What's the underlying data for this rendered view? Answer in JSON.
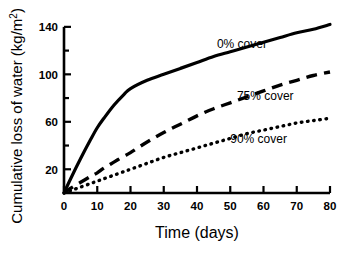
{
  "chart_data": {
    "type": "line",
    "title": "",
    "xlabel": "Time (days)",
    "ylabel": "Cumulative loss of water (kg/m",
    "ylabel_sup": "2",
    "ylabel_tail": ")",
    "xlim": [
      0,
      80
    ],
    "ylim": [
      0,
      150
    ],
    "grid": false,
    "legend_position": "inline-annotations",
    "x_ticks_major": [
      0,
      10,
      20,
      30,
      40,
      50,
      60,
      70,
      80
    ],
    "x_tick_labels": [
      "0",
      "10",
      "20",
      "30",
      "40",
      "50",
      "60",
      "70",
      "80"
    ],
    "y_ticks_major": [
      20,
      60,
      100,
      140
    ],
    "y_tick_labels": [
      "20",
      "60",
      "100",
      "140"
    ],
    "y_ticks_minor": [
      0,
      40,
      80,
      120
    ],
    "line_color": "#000000",
    "axis_color": "#000000",
    "x": [
      0,
      2,
      5,
      8,
      10,
      12,
      15,
      18,
      20,
      25,
      30,
      35,
      40,
      45,
      50,
      55,
      60,
      65,
      70,
      75,
      80
    ],
    "series": [
      {
        "name": "0% cover",
        "style": "solid",
        "label": "0% cover",
        "label_x": 46,
        "label_y": 122,
        "values": [
          0,
          12,
          29,
          45,
          55,
          63,
          74,
          83,
          88,
          95,
          100,
          105,
          110,
          115,
          119,
          123,
          127,
          131,
          135,
          138,
          142
        ]
      },
      {
        "name": "75% cover",
        "style": "dashed",
        "label": "75% cover",
        "label_x": 52,
        "label_y": 78,
        "values": [
          0,
          4,
          9,
          14,
          17,
          21,
          26,
          31,
          34,
          43,
          51,
          58,
          65,
          71,
          76,
          81,
          86,
          91,
          95,
          99,
          102
        ]
      },
      {
        "name": "90% cover",
        "style": "dotted",
        "label": "90% cover",
        "label_x": 50,
        "label_y": 42,
        "values": [
          0,
          2,
          5,
          8,
          10,
          12,
          15,
          18,
          20,
          25,
          30,
          34,
          38,
          42,
          46,
          50,
          53,
          56,
          59,
          61,
          63
        ]
      }
    ]
  }
}
